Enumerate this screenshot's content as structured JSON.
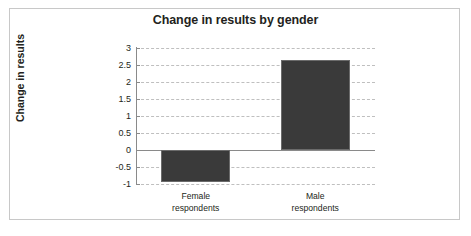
{
  "chart_data": {
    "type": "bar",
    "title": "Change in results by gender",
    "xlabel": "",
    "ylabel": "Change in results",
    "categories": [
      "Female respondents",
      "Male respondents"
    ],
    "category_lines": [
      [
        "Female",
        "respondents"
      ],
      [
        "Male",
        "respondents"
      ]
    ],
    "values": [
      -0.93,
      2.66
    ],
    "ylim": [
      -1,
      3
    ],
    "yticks": [
      3,
      2.5,
      2,
      1.5,
      1,
      0.5,
      0,
      -0.5,
      -1
    ],
    "ytick_labels": [
      "3",
      "2.5",
      "2",
      "1.5",
      "1",
      "0.5",
      "0",
      "-0.5",
      "-1"
    ],
    "grid": "horizontal-dashed",
    "legend": "none",
    "bar_color": "#3a3a3a",
    "grid_color": "#bfbfbf",
    "axis_color": "#8a8a8a",
    "frame_color": "#c8c8c8",
    "background": "#ffffff"
  }
}
